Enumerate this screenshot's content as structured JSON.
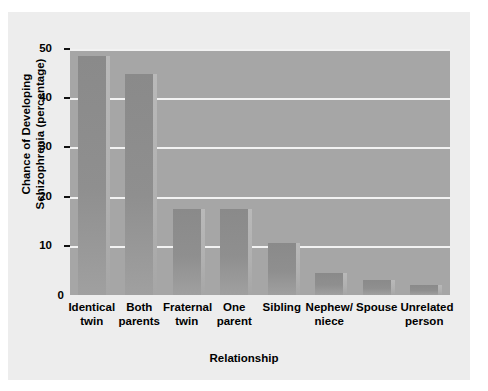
{
  "chart_data": {
    "type": "bar",
    "title": "",
    "xlabel": "Relationship",
    "ylabel": "Chance of Developing Schizophrenia (percentage)",
    "ylabel_line1": "Chance of Developing",
    "ylabel_line2": "Schizophrenia (percentage)",
    "categories": [
      "Identical twin",
      "Both parents",
      "Fraternal twin",
      "One parent",
      "Sibling",
      "Nephew/ niece",
      "Spouse",
      "Unrelated person"
    ],
    "category_lines": [
      [
        "Identical",
        "twin"
      ],
      [
        "Both",
        "parents"
      ],
      [
        "Fraternal",
        "twin"
      ],
      [
        "One",
        "parent"
      ],
      [
        "Sibling",
        ""
      ],
      [
        "Nephew/",
        "niece"
      ],
      [
        "Spouse",
        ""
      ],
      [
        "Unrelated",
        "person"
      ]
    ],
    "values": [
      48.5,
      45,
      17.5,
      17.5,
      10.5,
      4.5,
      3,
      2
    ],
    "ylim": [
      0,
      50
    ],
    "yticks": [
      0,
      10,
      20,
      30,
      40,
      50
    ],
    "ytick_labels": [
      "0",
      "10",
      "20",
      "30",
      "40",
      "50"
    ],
    "grid": "horizontal",
    "legend": "none",
    "colors": {
      "plot_background": "#a6a6a6",
      "figure_background": "#ededed",
      "page_background": "#ffffff",
      "bar_fill": "#8f8f8f",
      "gridline": "#f2f2f2",
      "text": "#000000"
    }
  }
}
